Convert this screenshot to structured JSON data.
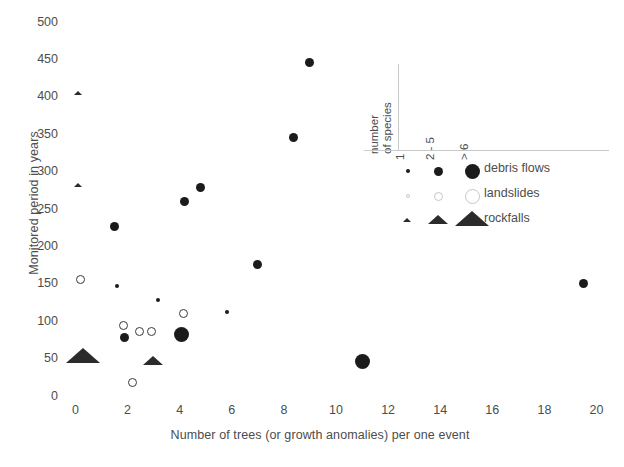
{
  "chart_data": {
    "type": "scatter",
    "title": "",
    "xlabel": "Number of trees (or growth anomalies) per one event",
    "ylabel": "Monitored period in years",
    "xlim": [
      0,
      20.8
    ],
    "ylim": [
      0,
      510
    ],
    "xticks": [
      "0",
      "2",
      "4",
      "6",
      "8",
      "10",
      "12",
      "14",
      "16",
      "18",
      "20"
    ],
    "yticks": [
      "0",
      "50",
      "100",
      "150",
      "200",
      "250",
      "300",
      "350",
      "400",
      "450",
      "500"
    ],
    "grid": false,
    "legend_position": "upper-right-inside",
    "size_encoding": {
      "label": "number of species",
      "levels": [
        {
          "key": "1",
          "label": "1",
          "px": 4
        },
        {
          "key": "2-5",
          "label": "2 - 5",
          "px": 9
        },
        {
          "key": ">6",
          "label": "> 6",
          "px": 15
        }
      ]
    },
    "series": [
      {
        "name": "debris flows",
        "marker": "filled-circle",
        "color": "#1b1b1b",
        "points": [
          {
            "x": 1.5,
            "y": 226,
            "species": "2-5"
          },
          {
            "x": 1.6,
            "y": 147,
            "species": "1"
          },
          {
            "x": 1.9,
            "y": 78,
            "species": "2-5"
          },
          {
            "x": 3.15,
            "y": 128,
            "species": "1"
          },
          {
            "x": 4.05,
            "y": 82,
            "species": ">6"
          },
          {
            "x": 4.2,
            "y": 259,
            "species": "2-5"
          },
          {
            "x": 4.8,
            "y": 278,
            "species": "2-5"
          },
          {
            "x": 5.8,
            "y": 112,
            "species": "1"
          },
          {
            "x": 7.0,
            "y": 175,
            "species": "2-5"
          },
          {
            "x": 8.35,
            "y": 345,
            "species": "2-5"
          },
          {
            "x": 9.0,
            "y": 445,
            "species": "2-5"
          },
          {
            "x": 11.0,
            "y": 45,
            "species": ">6"
          },
          {
            "x": 19.5,
            "y": 150,
            "species": "2-5"
          }
        ]
      },
      {
        "name": "landslides",
        "marker": "open-circle",
        "color": "#3a3a3a",
        "points": [
          {
            "x": 0.2,
            "y": 155,
            "species": "2-5"
          },
          {
            "x": 1.85,
            "y": 94,
            "species": "2-5"
          },
          {
            "x": 2.2,
            "y": 17,
            "species": "2-5"
          },
          {
            "x": 2.45,
            "y": 85,
            "species": "2-5"
          },
          {
            "x": 2.9,
            "y": 85,
            "species": "2-5"
          },
          {
            "x": 4.15,
            "y": 110,
            "species": "2-5"
          }
        ]
      },
      {
        "name": "rockfalls",
        "marker": "filled-triangle",
        "color": "#2b2b2b",
        "points": [
          {
            "x": 0.1,
            "y": 404,
            "species": "1"
          },
          {
            "x": 0.1,
            "y": 281,
            "species": "1"
          },
          {
            "x": 0.3,
            "y": 50,
            "species": ">6"
          },
          {
            "x": 3.0,
            "y": 45,
            "species": "2-5"
          }
        ]
      }
    ]
  },
  "legend": {
    "title_line1": "number",
    "title_line2": "of species",
    "columns": [
      "1",
      "2 - 5",
      "> 6"
    ],
    "rows": [
      {
        "label": "debris flows",
        "marker": "filled-circle"
      },
      {
        "label": "landslides",
        "marker": "open-circle"
      },
      {
        "label": "rockfalls",
        "marker": "filled-triangle"
      }
    ]
  }
}
